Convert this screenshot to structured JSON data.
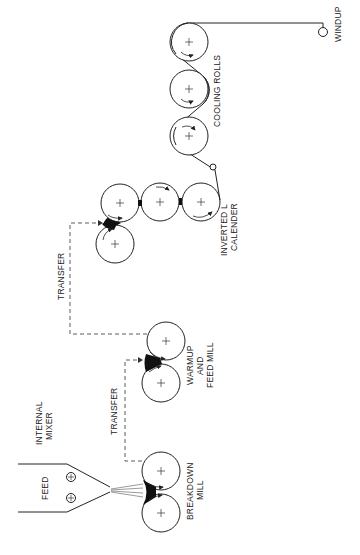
{
  "diagram": {
    "type": "process-flow",
    "orientation": "rotated-90-ccw",
    "labels": {
      "feed": "FEED",
      "internal_mixer_1": "INTERNAL",
      "internal_mixer_2": "MIXER",
      "breakdown_1": "BREAKDOWN",
      "breakdown_2": "MILL",
      "transfer_1": "TRANSFER",
      "transfer_2": "TRANSFER",
      "warmup_1": "WARMUP",
      "warmup_2": "AND",
      "warmup_3": "FEED MILL",
      "calender_1": "INVERTED L",
      "calender_2": "CALENDER",
      "cooling": "COOLING ROLLS",
      "windup": "WINDUP"
    },
    "stages": [
      {
        "id": "internal-mixer",
        "name": "Internal Mixer",
        "components": [
          "feed"
        ]
      },
      {
        "id": "breakdown-mill",
        "name": "Breakdown Mill",
        "rolls": 2
      },
      {
        "id": "warmup-feed-mill",
        "name": "Warmup and Feed Mill",
        "rolls": 2
      },
      {
        "id": "inverted-l-calender",
        "name": "Inverted L Calender",
        "rolls": 4
      },
      {
        "id": "cooling-rolls",
        "name": "Cooling Rolls",
        "rolls": 3
      },
      {
        "id": "windup",
        "name": "Windup"
      }
    ],
    "connections": [
      {
        "from": "internal-mixer",
        "to": "breakdown-mill",
        "style": "solid-stream"
      },
      {
        "from": "breakdown-mill",
        "to": "warmup-feed-mill",
        "style": "dashed",
        "label": "TRANSFER"
      },
      {
        "from": "warmup-feed-mill",
        "to": "inverted-l-calender",
        "style": "dashed",
        "label": "TRANSFER"
      },
      {
        "from": "inverted-l-calender",
        "to": "cooling-rolls",
        "style": "solid-web"
      },
      {
        "from": "cooling-rolls",
        "to": "windup",
        "style": "solid-web"
      }
    ]
  }
}
